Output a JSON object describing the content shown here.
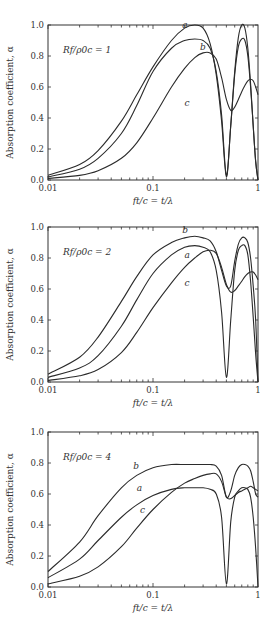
{
  "chart_data": [
    {
      "type": "line",
      "annotation": "Rf/ρ0c = 1",
      "xlabel": "ft/c = t/λ",
      "ylabel": "Absorption coefficient, α",
      "xscale": "log",
      "xlim": [
        0.01,
        1
      ],
      "ylim": [
        0.0,
        1.0
      ],
      "xticks": [
        "0.01",
        "0.1",
        "1"
      ],
      "yticks": [
        "0.0",
        "0.2",
        "0.4",
        "0.6",
        "0.8",
        "1.0"
      ],
      "grid": false,
      "series": [
        {
          "name": "a",
          "x": [
            0.01,
            0.02,
            0.03,
            0.05,
            0.07,
            0.1,
            0.15,
            0.2,
            0.25,
            0.3,
            0.35,
            0.4,
            0.45,
            0.5,
            0.55,
            0.6,
            0.65,
            0.7,
            0.75,
            0.8,
            0.85,
            0.9,
            0.95,
            1.0
          ],
          "y": [
            0.03,
            0.1,
            0.19,
            0.38,
            0.55,
            0.73,
            0.9,
            0.98,
            1.0,
            0.98,
            0.88,
            0.68,
            0.38,
            0.02,
            0.35,
            0.7,
            0.92,
            1.0,
            0.98,
            0.85,
            0.62,
            0.35,
            0.12,
            0.0
          ]
        },
        {
          "name": "b",
          "x": [
            0.01,
            0.02,
            0.03,
            0.05,
            0.07,
            0.1,
            0.15,
            0.2,
            0.25,
            0.3,
            0.35,
            0.4,
            0.45,
            0.5,
            0.55,
            0.6,
            0.65,
            0.7,
            0.75,
            0.8,
            0.85,
            0.9,
            0.95,
            1.0
          ],
          "y": [
            0.02,
            0.07,
            0.14,
            0.3,
            0.48,
            0.7,
            0.85,
            0.9,
            0.91,
            0.9,
            0.85,
            0.7,
            0.42,
            0.03,
            0.35,
            0.68,
            0.86,
            0.91,
            0.9,
            0.8,
            0.6,
            0.35,
            0.12,
            0.0
          ]
        },
        {
          "name": "c",
          "x": [
            0.01,
            0.02,
            0.03,
            0.05,
            0.07,
            0.1,
            0.15,
            0.2,
            0.25,
            0.3,
            0.35,
            0.4,
            0.45,
            0.5,
            0.55,
            0.6,
            0.65,
            0.7,
            0.75,
            0.8,
            0.85,
            0.9,
            0.95,
            1.0
          ],
          "y": [
            0.01,
            0.03,
            0.06,
            0.14,
            0.24,
            0.4,
            0.6,
            0.72,
            0.79,
            0.82,
            0.82,
            0.78,
            0.66,
            0.52,
            0.45,
            0.47,
            0.52,
            0.57,
            0.61,
            0.64,
            0.65,
            0.64,
            0.6,
            0.55
          ]
        }
      ],
      "labels": [
        {
          "text": "a",
          "x": 0.19,
          "y": 0.98
        },
        {
          "text": "b",
          "x": 0.28,
          "y": 0.84
        },
        {
          "text": "c",
          "x": 0.2,
          "y": 0.48
        }
      ]
    },
    {
      "type": "line",
      "annotation": "Rf/ρ0c = 2",
      "xlabel": "ft/c = t/λ",
      "ylabel": "Absorption coefficient, α",
      "xscale": "log",
      "xlim": [
        0.01,
        1
      ],
      "ylim": [
        0.0,
        1.0
      ],
      "xticks": [
        "0.01",
        "0.1",
        "1"
      ],
      "yticks": [
        "0.0",
        "0.2",
        "0.4",
        "0.6",
        "0.8",
        "1.0"
      ],
      "grid": false,
      "series": [
        {
          "name": "a",
          "x": [
            0.01,
            0.02,
            0.03,
            0.05,
            0.07,
            0.1,
            0.15,
            0.2,
            0.25,
            0.3,
            0.35,
            0.4,
            0.45,
            0.5,
            0.55,
            0.6,
            0.65,
            0.7,
            0.75,
            0.8,
            0.85,
            0.9,
            0.95,
            1.0
          ],
          "y": [
            0.03,
            0.09,
            0.17,
            0.36,
            0.53,
            0.7,
            0.82,
            0.87,
            0.88,
            0.87,
            0.84,
            0.72,
            0.45,
            0.03,
            0.4,
            0.72,
            0.85,
            0.88,
            0.88,
            0.82,
            0.65,
            0.42,
            0.18,
            0.0
          ]
        },
        {
          "name": "b",
          "x": [
            0.01,
            0.02,
            0.03,
            0.05,
            0.07,
            0.1,
            0.15,
            0.2,
            0.25,
            0.3,
            0.35,
            0.4,
            0.45,
            0.5,
            0.55,
            0.6,
            0.65,
            0.7,
            0.75,
            0.8,
            0.85,
            0.9,
            0.95,
            1.0
          ],
          "y": [
            0.05,
            0.16,
            0.29,
            0.52,
            0.68,
            0.82,
            0.9,
            0.93,
            0.94,
            0.93,
            0.91,
            0.84,
            0.72,
            0.62,
            0.62,
            0.78,
            0.89,
            0.93,
            0.93,
            0.9,
            0.8,
            0.62,
            0.4,
            0.0
          ]
        },
        {
          "name": "c",
          "x": [
            0.01,
            0.02,
            0.03,
            0.05,
            0.07,
            0.1,
            0.15,
            0.2,
            0.25,
            0.3,
            0.35,
            0.4,
            0.45,
            0.5,
            0.55,
            0.6,
            0.65,
            0.7,
            0.75,
            0.8,
            0.85,
            0.9,
            0.95,
            1.0
          ],
          "y": [
            0.01,
            0.04,
            0.08,
            0.19,
            0.32,
            0.48,
            0.64,
            0.74,
            0.8,
            0.84,
            0.85,
            0.83,
            0.74,
            0.63,
            0.58,
            0.59,
            0.62,
            0.65,
            0.68,
            0.7,
            0.71,
            0.71,
            0.69,
            0.66
          ]
        }
      ],
      "labels": [
        {
          "text": "b",
          "x": 0.19,
          "y": 0.96
        },
        {
          "text": "a",
          "x": 0.2,
          "y": 0.8
        },
        {
          "text": "c",
          "x": 0.2,
          "y": 0.62
        }
      ]
    },
    {
      "type": "line",
      "annotation": "Rf/ρ0c = 4",
      "xlabel": "ft/c = t/λ",
      "ylabel": "Absorption coefficient, α",
      "xscale": "log",
      "xlim": [
        0.01,
        1
      ],
      "ylim": [
        0.0,
        1.0
      ],
      "xticks": [
        "0.01",
        "0.1",
        "1"
      ],
      "yticks": [
        "0.0",
        "0.2",
        "0.4",
        "0.6",
        "0.8",
        "1.0"
      ],
      "grid": false,
      "series": [
        {
          "name": "a",
          "x": [
            0.01,
            0.02,
            0.03,
            0.05,
            0.07,
            0.1,
            0.15,
            0.2,
            0.25,
            0.3,
            0.35,
            0.4,
            0.45,
            0.5,
            0.55,
            0.6,
            0.65,
            0.7,
            0.75,
            0.8,
            0.85,
            0.9,
            0.95,
            1.0
          ],
          "y": [
            0.06,
            0.18,
            0.3,
            0.45,
            0.53,
            0.59,
            0.63,
            0.64,
            0.64,
            0.64,
            0.63,
            0.6,
            0.45,
            0.02,
            0.42,
            0.58,
            0.62,
            0.64,
            0.64,
            0.63,
            0.58,
            0.45,
            0.25,
            0.0
          ]
        },
        {
          "name": "b",
          "x": [
            0.01,
            0.02,
            0.03,
            0.05,
            0.07,
            0.1,
            0.15,
            0.2,
            0.25,
            0.3,
            0.35,
            0.4,
            0.45,
            0.5,
            0.55,
            0.6,
            0.65,
            0.7,
            0.75,
            0.8,
            0.85,
            0.9,
            0.95,
            1.0
          ],
          "y": [
            0.1,
            0.29,
            0.46,
            0.64,
            0.72,
            0.77,
            0.79,
            0.79,
            0.79,
            0.79,
            0.79,
            0.78,
            0.72,
            0.58,
            0.62,
            0.72,
            0.77,
            0.79,
            0.79,
            0.78,
            0.75,
            0.68,
            0.6,
            0.58
          ]
        },
        {
          "name": "c",
          "x": [
            0.01,
            0.02,
            0.03,
            0.05,
            0.07,
            0.1,
            0.15,
            0.2,
            0.25,
            0.3,
            0.35,
            0.4,
            0.45,
            0.5,
            0.55,
            0.6,
            0.65,
            0.7,
            0.75,
            0.8,
            0.85,
            0.9,
            0.95,
            1.0
          ],
          "y": [
            0.02,
            0.07,
            0.13,
            0.26,
            0.38,
            0.5,
            0.61,
            0.67,
            0.7,
            0.72,
            0.73,
            0.73,
            0.68,
            0.58,
            0.57,
            0.59,
            0.61,
            0.62,
            0.63,
            0.64,
            0.65,
            0.64,
            0.63,
            0.62
          ]
        }
      ],
      "labels": [
        {
          "text": "b",
          "x": 0.065,
          "y": 0.76
        },
        {
          "text": "a",
          "x": 0.07,
          "y": 0.62
        },
        {
          "text": "c",
          "x": 0.075,
          "y": 0.48
        }
      ]
    }
  ]
}
